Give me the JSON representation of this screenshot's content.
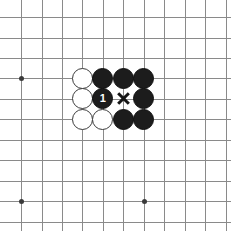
{
  "figure": {
    "board": {
      "background_color": "#ffffff",
      "line_color": "#8a8a8a",
      "star_point_color": "#3a3a3a",
      "cell_size": 20.45,
      "origin_x": 21,
      "origin_y": 17,
      "columns": 11,
      "rows": 11
    },
    "star_points": [
      {
        "col": 0,
        "row": 3,
        "name": "star-point-upper-left"
      },
      {
        "col": 0,
        "row": 9,
        "name": "star-point-lower-left"
      },
      {
        "col": 6,
        "row": 9,
        "name": "star-point-lower-right"
      }
    ],
    "stones": [
      {
        "col": 3,
        "row": 3,
        "color": "white",
        "label": "",
        "name": "white-stone-c3r3"
      },
      {
        "col": 4,
        "row": 3,
        "color": "black",
        "label": "",
        "name": "black-stone-c4r3"
      },
      {
        "col": 5,
        "row": 3,
        "color": "black",
        "label": "",
        "name": "black-stone-c5r3"
      },
      {
        "col": 6,
        "row": 3,
        "color": "black",
        "label": "",
        "name": "black-stone-c6r3"
      },
      {
        "col": 3,
        "row": 4,
        "color": "white",
        "label": "",
        "name": "white-stone-c3r4"
      },
      {
        "col": 4,
        "row": 4,
        "color": "black",
        "label": "1",
        "name": "black-stone-move-1"
      },
      {
        "col": 6,
        "row": 4,
        "color": "black",
        "label": "",
        "name": "black-stone-c6r4"
      },
      {
        "col": 3,
        "row": 5,
        "color": "white",
        "label": "",
        "name": "white-stone-c3r5"
      },
      {
        "col": 4,
        "row": 5,
        "color": "white",
        "label": "",
        "name": "white-stone-c4r5"
      },
      {
        "col": 5,
        "row": 5,
        "color": "black",
        "label": "",
        "name": "black-stone-c5r5"
      },
      {
        "col": 6,
        "row": 5,
        "color": "black",
        "label": "",
        "name": "black-stone-c6r5"
      }
    ],
    "marks": [
      {
        "col": 5,
        "row": 4,
        "type": "x",
        "color": "#151515",
        "name": "x-mark-c5r4"
      }
    ],
    "move_number_label": "1"
  }
}
